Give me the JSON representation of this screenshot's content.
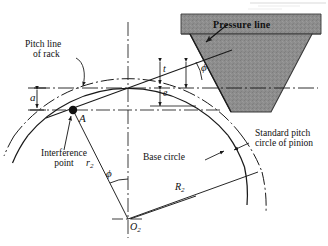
{
  "figure": {
    "domain_note": "engineering line diagram"
  },
  "labels": {
    "pitch_line_l1": "Pitch line",
    "pitch_line_l2": "of rack",
    "pressure_line": "Pressure line",
    "interference_l1": "Interference",
    "interference_l2": "point",
    "base_circle": "Base circle",
    "std_pitch_l1": "Standard pitch",
    "std_pitch_l2": "circle of pinion",
    "point_a": "A",
    "dim_a": "a",
    "dim_t": "t",
    "dim_e": "e",
    "radius_r2_sym": "r",
    "radius_r2_sub": "2",
    "radius_R2_sym": "R",
    "radius_R2_sub": "2",
    "center_sym": "O",
    "center_sub": "2",
    "angle_phi_top": "ϕ",
    "angle_phi_center": "ϕ"
  },
  "colors": {
    "ink": "#1a1a1a",
    "rack_fill": "#8d8d8d",
    "rack_fill_light": "#9a9a9a",
    "rack_stroke": "#2b2b2b",
    "background": "#ffffff",
    "artifact": "#d8d8d8"
  },
  "geometry": {
    "center_o2": [
      128,
      219
    ],
    "point_a": [
      73,
      110
    ],
    "pitch_point": [
      128,
      88
    ],
    "base_circle_radius": 130,
    "pitch_circle_radius": 142,
    "pressure_angle_deg": 20
  }
}
